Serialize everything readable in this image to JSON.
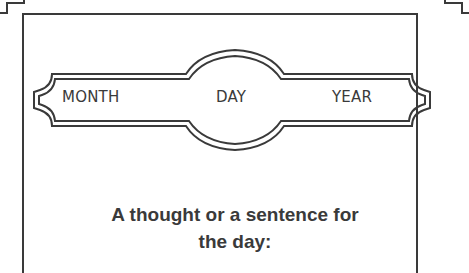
{
  "worksheet": {
    "date_banner": {
      "month_label": "MONTH",
      "day_label": "DAY",
      "year_label": "YEAR"
    },
    "prompt": {
      "line1": "A thought or a sentence for",
      "line2": "the day:"
    }
  },
  "colors": {
    "ink": "#3a3a3a",
    "background": "#ffffff"
  }
}
